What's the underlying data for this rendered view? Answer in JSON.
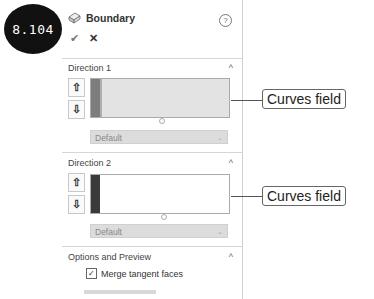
{
  "badge": {
    "label": "8.104"
  },
  "panel": {
    "title": "Boundary",
    "feature_icon": "boundary-feature-icon",
    "help_icon": "?",
    "ok_icon": "✔",
    "cancel_icon": "✕",
    "direction1": {
      "title": "Direction 1",
      "collapse_icon": "^",
      "up_icon": "⇧",
      "down_icon": "⇩",
      "dropdown_value": "Default",
      "dropdown_chevron": "⌄"
    },
    "direction2": {
      "title": "Direction 2",
      "collapse_icon": "^",
      "up_icon": "⇧",
      "down_icon": "⇩",
      "dropdown_value": "Default",
      "dropdown_chevron": "⌄"
    },
    "options": {
      "title": "Options and Preview",
      "collapse_icon": "^",
      "merge_tangent_faces": {
        "label": "Merge tangent faces",
        "checked": true,
        "check_glyph": "✓"
      }
    }
  },
  "callouts": [
    {
      "label": "Curves field"
    },
    {
      "label": "Curves field"
    }
  ]
}
